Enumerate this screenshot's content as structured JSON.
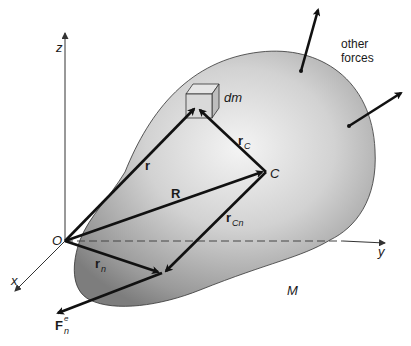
{
  "diagram": {
    "axes": {
      "z_label": "z",
      "y_label": "y",
      "x_label": "x",
      "origin_label": "O"
    },
    "body": {
      "mass_label": "M",
      "element_label": "dm",
      "center_label": "C"
    },
    "vectors": {
      "r": "r",
      "R": "R",
      "r_C": "r",
      "r_C_sub": "C",
      "r_Cn": "r",
      "r_Cn_sub": "Cn",
      "r_n": "r",
      "r_n_sub": "n",
      "F_n": "F",
      "F_n_sub": "n",
      "F_n_sup": "e"
    },
    "annotations": {
      "other_forces_line1": "other",
      "other_forces_line2": "forces"
    },
    "colors": {
      "body_light": "#f2f2f2",
      "body_dark": "#8a8a8a",
      "vector": "#111111",
      "axis": "#333333"
    }
  }
}
